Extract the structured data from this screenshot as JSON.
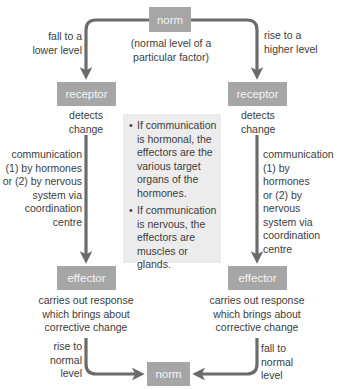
{
  "diagram": {
    "nodes": {
      "norm_top": "norm",
      "norm_top_caption": [
        "(normal level of a",
        "particular factor)"
      ],
      "receptor_left": "receptor",
      "receptor_right": "receptor",
      "effector_left": "effector",
      "effector_right": "effector",
      "norm_bottom": "norm"
    },
    "labels": {
      "fall_lower": [
        "fall to a",
        "lower level"
      ],
      "rise_higher": [
        "rise to a",
        "higher level"
      ],
      "detects_left": [
        "detects",
        "change"
      ],
      "detects_right": [
        "detects",
        "change"
      ],
      "comm_left": [
        "communication",
        "(1) by hormones",
        "or (2) by nervous",
        "system via",
        "coordination",
        "centre"
      ],
      "comm_right": [
        "communication",
        "(1) by hormones",
        "or (2) by nervous",
        "system via",
        "coordination",
        "centre"
      ],
      "response_left": [
        "carries out response",
        "which brings about",
        "corrective change"
      ],
      "response_right": [
        "carries out response",
        "which brings about",
        "corrective change"
      ],
      "rise_normal": [
        "rise to",
        "normal",
        "level"
      ],
      "fall_normal": [
        "fall to",
        "normal",
        "level"
      ]
    },
    "info_box": {
      "bullet": "•",
      "items": [
        [
          "If communication",
          "is hormonal, the",
          "effectors are the",
          "various target",
          "organs of the",
          "hormones."
        ],
        [
          "If communication",
          "is nervous, the",
          "effectors are",
          "muscles or glands."
        ]
      ]
    },
    "colors": {
      "box_fill": "#a6a6a6",
      "box_text": "#f4f4f4",
      "arrow": "#6b6b6b",
      "info_fill": "#ececec",
      "text": "#3c3c3c"
    }
  }
}
